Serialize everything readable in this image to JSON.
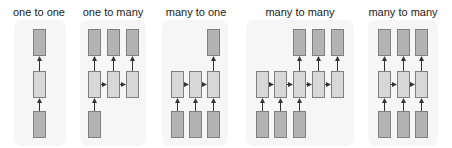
{
  "colors": {
    "background": "#ffffff",
    "panel": "#f6f6f6",
    "io_box_fill": "#b3b3b3",
    "hidden_box_fill": "#d7d7d7",
    "box_border": "#7f7f7f",
    "arrow": "#333333"
  },
  "box": {
    "width": 12,
    "height": 26
  },
  "rows": {
    "output_y": 29,
    "hidden_y": 71,
    "input_y": 111
  },
  "groups": [
    {
      "title": "one to one",
      "title_x": 39,
      "panel": {
        "x": 14,
        "y": 20,
        "w": 52,
        "h": 126
      },
      "columns": [
        33
      ],
      "outputs": [
        0
      ],
      "hidden": [
        0
      ],
      "inputs": [
        0
      ]
    },
    {
      "title": "one to many",
      "title_x": 113,
      "panel": {
        "x": 80,
        "y": 20,
        "w": 66,
        "h": 126
      },
      "columns": [
        88,
        107,
        126
      ],
      "outputs": [
        0,
        1,
        2
      ],
      "hidden": [
        0,
        1,
        2
      ],
      "inputs": [
        0
      ]
    },
    {
      "title": "many to one",
      "title_x": 196,
      "panel": {
        "x": 162,
        "y": 20,
        "w": 66,
        "h": 126
      },
      "columns": [
        171,
        189,
        207
      ],
      "outputs": [
        2
      ],
      "hidden": [
        0,
        1,
        2
      ],
      "inputs": [
        0,
        1,
        2
      ]
    },
    {
      "title": "many to many",
      "title_x": 300,
      "panel": {
        "x": 246,
        "y": 20,
        "w": 108,
        "h": 126
      },
      "columns": [
        256,
        274,
        293,
        312,
        331
      ],
      "outputs": [
        2,
        3,
        4
      ],
      "hidden": [
        0,
        1,
        2,
        3,
        4
      ],
      "inputs": [
        0,
        1,
        2
      ]
    },
    {
      "title": "many to many",
      "title_x": 403,
      "panel": {
        "x": 368,
        "y": 20,
        "w": 70,
        "h": 126
      },
      "columns": [
        378,
        397,
        415
      ],
      "outputs": [
        0,
        1,
        2
      ],
      "hidden": [
        0,
        1,
        2
      ],
      "inputs": [
        0,
        1,
        2
      ]
    }
  ]
}
